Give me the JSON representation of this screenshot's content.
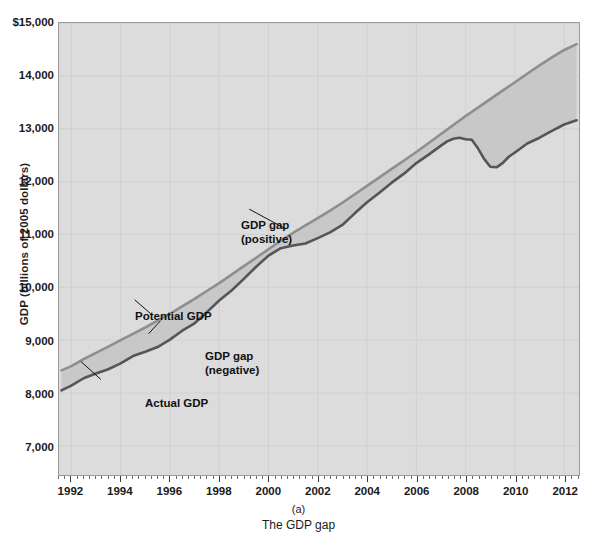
{
  "chart_data": {
    "type": "line",
    "title": "",
    "caption_label": "(a)",
    "caption_title": "The GDP gap",
    "xlabel": "",
    "ylabel": "GDP (billions of 2005 dollars)",
    "xlim": [
      1991.5,
      2012.6
    ],
    "ylim": [
      6450,
      15000
    ],
    "grid": true,
    "legend_position": "inline-annotations",
    "ytick_labels": [
      "$15,000",
      "14,000",
      "13,000",
      "12,000",
      "11,000",
      "10,000",
      "9,000",
      "8,000",
      "7,000"
    ],
    "ytick_values": [
      15000,
      14000,
      13000,
      12000,
      11000,
      10000,
      9000,
      8000,
      7000
    ],
    "xtick_labels": [
      "1992",
      "1994",
      "1996",
      "1998",
      "2000",
      "2002",
      "2004",
      "2006",
      "2008",
      "2010",
      "2012"
    ],
    "xtick_values": [
      1992,
      1994,
      1996,
      1998,
      2000,
      2002,
      2004,
      2006,
      2008,
      2010,
      2012
    ],
    "x_minor_tick_interval": 0.25,
    "series": [
      {
        "name": "Potential GDP",
        "color": "#8e8e8e",
        "x": [
          1991.6,
          1992.0,
          1992.5,
          1993.0,
          1993.5,
          1994.0,
          1994.5,
          1995.0,
          1995.5,
          1996.0,
          1996.5,
          1997.0,
          1997.5,
          1998.0,
          1998.5,
          1999.0,
          1999.5,
          2000.0,
          2000.5,
          2001.0,
          2001.5,
          2002.0,
          2002.5,
          2003.0,
          2003.5,
          2004.0,
          2004.5,
          2005.0,
          2005.5,
          2006.0,
          2006.5,
          2007.0,
          2007.5,
          2008.0,
          2008.5,
          2009.0,
          2009.5,
          2010.0,
          2010.5,
          2011.0,
          2011.5,
          2012.0,
          2012.5
        ],
        "values": [
          8430,
          8510,
          8640,
          8760,
          8880,
          9000,
          9120,
          9240,
          9370,
          9500,
          9640,
          9780,
          9930,
          10080,
          10240,
          10400,
          10560,
          10720,
          10880,
          11030,
          11170,
          11310,
          11450,
          11600,
          11760,
          11920,
          12080,
          12240,
          12400,
          12560,
          12730,
          12900,
          13070,
          13240,
          13400,
          13560,
          13720,
          13880,
          14040,
          14200,
          14350,
          14490,
          14600
        ]
      },
      {
        "name": "Actual GDP",
        "color": "#555555",
        "x": [
          1991.6,
          1992.0,
          1992.5,
          1993.0,
          1993.5,
          1994.0,
          1994.5,
          1995.0,
          1995.5,
          1996.0,
          1996.5,
          1997.0,
          1997.5,
          1998.0,
          1998.5,
          1999.0,
          1999.5,
          2000.0,
          2000.5,
          2001.0,
          2001.5,
          2002.0,
          2002.5,
          2003.0,
          2003.5,
          2004.0,
          2004.5,
          2005.0,
          2005.5,
          2006.0,
          2006.5,
          2007.0,
          2007.25,
          2007.5,
          2007.75,
          2008.0,
          2008.25,
          2008.5,
          2008.75,
          2009.0,
          2009.25,
          2009.5,
          2009.75,
          2010.0,
          2010.5,
          2011.0,
          2011.5,
          2012.0,
          2012.5
        ],
        "values": [
          8050,
          8140,
          8280,
          8370,
          8450,
          8560,
          8700,
          8780,
          8870,
          9010,
          9180,
          9320,
          9530,
          9750,
          9940,
          10160,
          10390,
          10600,
          10740,
          10790,
          10830,
          10930,
          11040,
          11180,
          11400,
          11610,
          11790,
          11980,
          12150,
          12350,
          12510,
          12680,
          12760,
          12810,
          12830,
          12800,
          12790,
          12630,
          12430,
          12280,
          12270,
          12350,
          12470,
          12550,
          12720,
          12830,
          12960,
          13080,
          13160
        ]
      }
    ],
    "annotations": [
      {
        "id": "gap-positive",
        "text_line1": "GDP gap",
        "text_line2": "(positive)"
      },
      {
        "id": "potential",
        "text_line1": "Potential GDP",
        "text_line2": ""
      },
      {
        "id": "gap-negative",
        "text_line1": "GDP gap",
        "text_line2": "(negative)"
      },
      {
        "id": "actual",
        "text_line1": "Actual GDP",
        "text_line2": ""
      }
    ],
    "colors": {
      "plot_background": "#dcdcdc",
      "gridline": "#d0d0d0",
      "frame": "#9a9a9a",
      "potential_line": "#8e8e8e",
      "actual_line": "#555555",
      "gap_fill": "#c6c6c6",
      "text": "#1a1a1a"
    }
  }
}
